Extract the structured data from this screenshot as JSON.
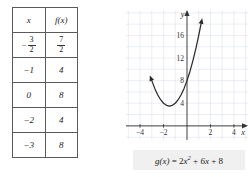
{
  "figure": {
    "table": {
      "headers": [
        "x",
        "f(x)"
      ],
      "rows": [
        {
          "x": "-3/2",
          "x_num": "3",
          "x_den": "2",
          "x_sign": "−",
          "fx": "7/2",
          "fx_num": "7",
          "fx_den": "2",
          "x_is_fraction": true,
          "fx_is_fraction": true
        },
        {
          "x": "−1",
          "fx": "4",
          "x_is_fraction": false,
          "fx_is_fraction": false
        },
        {
          "x": "0",
          "fx": "8",
          "x_is_fraction": false,
          "fx_is_fraction": false
        },
        {
          "x": "−2",
          "fx": "4",
          "x_is_fraction": false,
          "fx_is_fraction": false
        },
        {
          "x": "−3",
          "fx": "8",
          "x_is_fraction": false,
          "fx_is_fraction": false
        }
      ]
    },
    "caption": {
      "function_name": "g(x)",
      "equals": "=",
      "term1_coeff": "2",
      "term1_var": "x",
      "term1_exp": "2",
      "plus1": "+",
      "term2": "6x",
      "plus2": "+",
      "term3": "8",
      "full_text": "g(x) = 2x² + 6x + 8"
    },
    "chart_data": {
      "type": "line",
      "title": "",
      "subtitle": "",
      "xlabel": "x",
      "ylabel": "y",
      "equation": "g(x) = 2x^2 + 6x + 8",
      "curve_label": "g",
      "xlim": [
        -5.2,
        5.2
      ],
      "ylim": [
        -2.5,
        20.5
      ],
      "xticks": [
        -4,
        -2,
        2,
        4
      ],
      "xtick_labels": [
        "−4",
        "−2",
        "2",
        "4"
      ],
      "yticks": [
        4,
        8,
        12,
        16
      ],
      "ytick_labels": [
        "4",
        "8",
        "12",
        "16"
      ],
      "grid": true,
      "grid_step": 1,
      "grid_color": "#d7dde6",
      "axis_color": "#333333",
      "curve_color": "#2b2b2b",
      "legend": "none",
      "vertex": [
        -1.5,
        3.5
      ],
      "y_intercept": 8,
      "arrows": [
        "both-ends-of-curve",
        "x-axis-right",
        "y-axis-up"
      ],
      "points": [
        {
          "x": -3.0,
          "y": 8.0
        },
        {
          "x": -2.75,
          "y": 6.63
        },
        {
          "x": -2.5,
          "y": 5.5
        },
        {
          "x": -2.25,
          "y": 4.63
        },
        {
          "x": -2.0,
          "y": 4.0
        },
        {
          "x": -1.75,
          "y": 3.63
        },
        {
          "x": -1.5,
          "y": 3.5
        },
        {
          "x": -1.25,
          "y": 3.63
        },
        {
          "x": -1.0,
          "y": 4.0
        },
        {
          "x": -0.75,
          "y": 4.63
        },
        {
          "x": -0.5,
          "y": 5.5
        },
        {
          "x": -0.25,
          "y": 6.63
        },
        {
          "x": 0.0,
          "y": 8.0
        },
        {
          "x": 0.25,
          "y": 9.63
        },
        {
          "x": 0.5,
          "y": 11.5
        },
        {
          "x": 0.75,
          "y": 13.63
        },
        {
          "x": 1.0,
          "y": 16.0
        },
        {
          "x": 1.2,
          "y": 18.08
        }
      ]
    }
  }
}
